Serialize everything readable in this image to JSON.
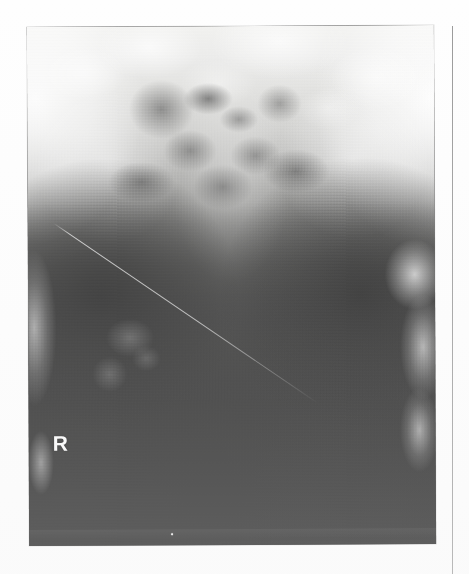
{
  "page": {
    "background_color": "#ffffff",
    "type": "scanned-printed-page",
    "margin_rule_color": "#9a9a9a"
  },
  "figure": {
    "name": "pelvis-radiograph",
    "modality": "X-ray",
    "projection": "AP pelvis",
    "film_tone_light": "#f2f2f0",
    "film_tone_dark": "#252524"
  },
  "annotations": {
    "side_marker": "R",
    "side_marker_color": "#fbfbfb",
    "side_marker_meaning": "right-side-laterality-marker"
  },
  "artifacts": {
    "scratch_label": "diagonal film scratch",
    "fiducial_label": "bright fiducial dot"
  }
}
